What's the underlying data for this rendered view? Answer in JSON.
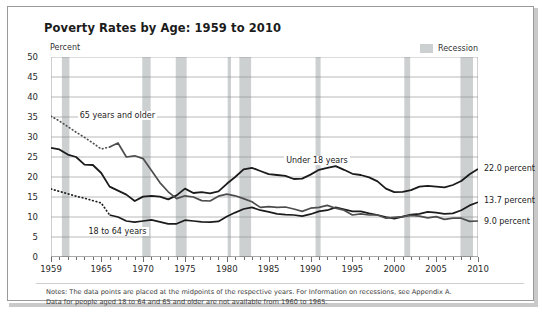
{
  "chart_data": {
    "type": "line",
    "title": "Poverty Rates by Age: 1959 to 2010",
    "ylabel": "Percent",
    "xlabel": "",
    "ylim": [
      0,
      50
    ],
    "ytick_step": 5,
    "yticks": [
      "50",
      "45",
      "40",
      "35",
      "30",
      "25",
      "20",
      "15",
      "10",
      "5",
      "0"
    ],
    "xlim": [
      1959,
      2010
    ],
    "xticks": [
      "1959",
      "1965",
      "1970",
      "1975",
      "1980",
      "1985",
      "1990",
      "1995",
      "2000",
      "2005",
      "2010"
    ],
    "xtick_values": [
      1959,
      1965,
      1970,
      1975,
      1980,
      1985,
      1990,
      1995,
      2000,
      2005,
      2010
    ],
    "grid": "horizontal",
    "legend_position": "top-right",
    "legend": [
      {
        "label": "Recession",
        "color": "#ccd0d1",
        "type": "band"
      }
    ],
    "x": [
      1959,
      1960,
      1961,
      1962,
      1963,
      1964,
      1965,
      1966,
      1967,
      1968,
      1969,
      1970,
      1971,
      1972,
      1973,
      1974,
      1975,
      1976,
      1977,
      1978,
      1979,
      1980,
      1981,
      1982,
      1983,
      1984,
      1985,
      1986,
      1987,
      1988,
      1989,
      1990,
      1991,
      1992,
      1993,
      1994,
      1995,
      1996,
      1997,
      1998,
      1999,
      2000,
      2001,
      2002,
      2003,
      2004,
      2005,
      2006,
      2007,
      2008,
      2009,
      2010
    ],
    "series": [
      {
        "name": "Under 18 years",
        "annotation": "Under 18 years",
        "end_label": "22.0 percent",
        "end_value": 22.0,
        "color": "#1b1b1b",
        "style": "solid",
        "values": [
          27.3,
          26.9,
          25.6,
          25.0,
          23.1,
          23.0,
          21.0,
          17.6,
          16.6,
          15.6,
          14.0,
          15.1,
          15.3,
          15.1,
          14.4,
          15.4,
          17.1,
          16.0,
          16.2,
          15.9,
          16.4,
          18.3,
          20.0,
          21.9,
          22.3,
          21.5,
          20.7,
          20.5,
          20.3,
          19.5,
          19.6,
          20.6,
          21.8,
          22.3,
          22.7,
          21.8,
          20.8,
          20.5,
          19.9,
          18.9,
          17.1,
          16.2,
          16.3,
          16.7,
          17.6,
          17.8,
          17.6,
          17.4,
          18.0,
          19.0,
          20.7,
          22.0
        ]
      },
      {
        "name": "18 to 64 years",
        "annotation": "18 to 64 years",
        "end_label": "13.7 percent",
        "end_value": 13.7,
        "color": "#1b1b1b",
        "style": "solid-dotted-start",
        "dotted_range": [
          1959,
          1966
        ],
        "values": [
          17.0,
          16.4,
          15.8,
          15.2,
          14.7,
          14.1,
          13.5,
          10.5,
          10.0,
          9.0,
          8.7,
          9.0,
          9.3,
          8.8,
          8.3,
          8.3,
          9.2,
          9.0,
          8.8,
          8.7,
          8.9,
          10.1,
          11.1,
          12.0,
          12.4,
          11.7,
          11.3,
          10.8,
          10.6,
          10.5,
          10.2,
          10.7,
          11.4,
          11.7,
          12.4,
          11.9,
          11.4,
          11.4,
          10.9,
          10.5,
          10.0,
          9.6,
          10.1,
          10.6,
          10.8,
          11.3,
          11.1,
          10.8,
          10.9,
          11.7,
          12.9,
          13.7
        ]
      },
      {
        "name": "65 years and older",
        "annotation": "65 years and older",
        "end_label": "9.0 percent",
        "end_value": 9.0,
        "color": "#4d4d4d",
        "style": "solid-dotted-start",
        "dotted_range": [
          1959,
          1966
        ],
        "values": [
          35.2,
          34.0,
          32.6,
          31.2,
          29.9,
          28.5,
          27.0,
          27.5,
          28.5,
          25.0,
          25.3,
          24.6,
          21.6,
          18.6,
          16.3,
          14.6,
          15.3,
          15.0,
          14.1,
          14.0,
          15.2,
          15.7,
          15.3,
          14.6,
          13.8,
          12.4,
          12.6,
          12.4,
          12.5,
          12.0,
          11.4,
          12.2,
          12.4,
          12.9,
          12.2,
          11.7,
          10.5,
          10.8,
          10.5,
          10.5,
          9.7,
          9.9,
          10.1,
          10.4,
          10.2,
          9.8,
          10.1,
          9.4,
          9.7,
          9.7,
          8.9,
          9.0
        ]
      }
    ],
    "recessions": [
      {
        "start": 1960.3,
        "end": 1961.2
      },
      {
        "start": 1969.9,
        "end": 1970.9
      },
      {
        "start": 1973.9,
        "end": 1975.2
      },
      {
        "start": 1980.1,
        "end": 1980.5
      },
      {
        "start": 1981.5,
        "end": 1982.9
      },
      {
        "start": 1990.6,
        "end": 1991.2
      },
      {
        "start": 2001.2,
        "end": 2001.9
      },
      {
        "start": 2007.9,
        "end": 2009.4
      }
    ],
    "notes": [
      "Notes:  The data points are placed at the midpoints of the respective years. For Information on recessions, see Appendix A.",
      "Data for people aged 18 to 64 and 65 and older are not available from 1960 to 1965."
    ]
  }
}
